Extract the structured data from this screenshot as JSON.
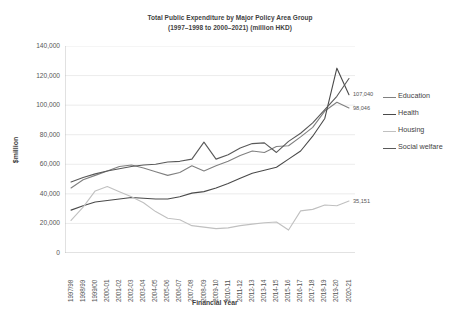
{
  "chart_data": {
    "type": "line",
    "title": "Total Public Expenditure by Major Policy Area Group (1997–1998 to 2000–2021) (million HKD)",
    "title_line1": "Total Public Expenditure by Major Policy Area Group",
    "title_line2": "(1997–1998 to 2000–2021) (million HKD)",
    "xlabel": "Financial Year",
    "ylabel": "$million",
    "ylim": [
      0,
      140000
    ],
    "ytick_labels": [
      "140,000",
      "120,000",
      "100,000",
      "80,000",
      "60,000",
      "40,000",
      "20,000",
      "0"
    ],
    "ytick_values": [
      140000,
      120000,
      100000,
      80000,
      60000,
      40000,
      20000,
      0
    ],
    "grid": true,
    "legend_position": "right",
    "categories": [
      "1997/98",
      "1998/99",
      "1999/00",
      "2000-01",
      "2001-02",
      "2002-03",
      "2003-04",
      "2004-05",
      "2005-06",
      "2006-07",
      "2007-08",
      "2008-09",
      "2009-10",
      "2010-11",
      "2011-12",
      "2012-13",
      "2013-14",
      "2014-15",
      "2015-16",
      "2016-17",
      "2017-18",
      "2018-19",
      "2019-20",
      "2020-21"
    ],
    "series": [
      {
        "name": "Education",
        "color": "#808080",
        "end_label": "98,046",
        "values": [
          44000,
          49500,
          52500,
          55500,
          58500,
          59500,
          57500,
          55000,
          52500,
          54500,
          59000,
          55500,
          59000,
          62000,
          66000,
          69000,
          68000,
          72000,
          72500,
          78500,
          85000,
          96000,
          102000,
          98046
        ]
      },
      {
        "name": "Health",
        "color": "#4a4a4a",
        "end_label": "107,040",
        "values": [
          29000,
          32000,
          34500,
          35500,
          36500,
          37500,
          37000,
          36500,
          36500,
          38000,
          40500,
          41500,
          44000,
          47000,
          50500,
          54000,
          56000,
          58000,
          63500,
          69000,
          79000,
          91000,
          125000,
          107040
        ]
      },
      {
        "name": "Housing",
        "color": "#c0c0c0",
        "end_label": "35,151",
        "values": [
          22000,
          31000,
          42000,
          45000,
          41500,
          38000,
          34000,
          28000,
          23500,
          22500,
          18500,
          17500,
          16500,
          17000,
          18500,
          19500,
          20500,
          21000,
          15500,
          28500,
          29500,
          32500,
          32000,
          35151
        ]
      },
      {
        "name": "Social welfare",
        "color": "#595959",
        "end_label": "",
        "values": [
          48000,
          51000,
          53500,
          55500,
          57000,
          58500,
          59500,
          60000,
          61500,
          62000,
          63500,
          75000,
          63500,
          66500,
          71000,
          74000,
          74500,
          68000,
          75500,
          81000,
          88000,
          97000,
          106000,
          118000
        ]
      }
    ],
    "annotations": [
      {
        "text": "107,040",
        "series": "Health"
      },
      {
        "text": "98,046",
        "series": "Education"
      },
      {
        "text": "35,151",
        "series": "Housing"
      }
    ]
  },
  "legend": {
    "items": [
      {
        "label": "Education"
      },
      {
        "label": "Health"
      },
      {
        "label": "Housing"
      },
      {
        "label": "Social welfare"
      }
    ]
  }
}
